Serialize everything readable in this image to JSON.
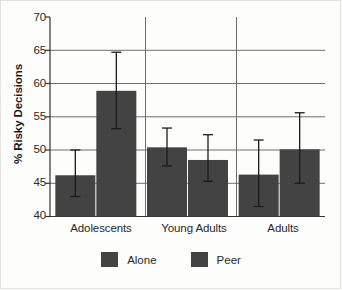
{
  "chart_data": {
    "type": "bar",
    "title": "",
    "xlabel": "",
    "ylabel": "% Risky Decisions",
    "ylim": [
      40,
      70
    ],
    "yticks": [
      40,
      45,
      50,
      55,
      60,
      65,
      70
    ],
    "ytick_labels": [
      "40",
      "45",
      "50",
      "55",
      "60",
      "65",
      "70"
    ],
    "grid": true,
    "grid_axis": "y",
    "legend_position": "bottom",
    "categories": [
      "Adolescents",
      "Young Adults",
      "Adults"
    ],
    "series": [
      {
        "name": "Alone",
        "color": "#434343",
        "values": [
          46.2,
          50.4,
          46.3
        ],
        "error_low": [
          43.0,
          47.6,
          41.5
        ],
        "error_high": [
          50.0,
          53.3,
          51.5
        ]
      },
      {
        "name": "Peer",
        "color": "#434343",
        "values": [
          58.9,
          48.5,
          50.1
        ],
        "error_low": [
          53.2,
          45.3,
          45.0
        ],
        "error_high": [
          64.7,
          52.3,
          55.6
        ]
      }
    ]
  },
  "legend": {
    "entries": [
      {
        "label": "Alone",
        "swatch": "legend-swatch-alone"
      },
      {
        "label": "Peer",
        "swatch": "legend-swatch-peer"
      }
    ]
  },
  "colors": {
    "bar": "#434343",
    "grid": "#6e6e6e",
    "axis": "#333333",
    "background": "#fdfdfc"
  }
}
